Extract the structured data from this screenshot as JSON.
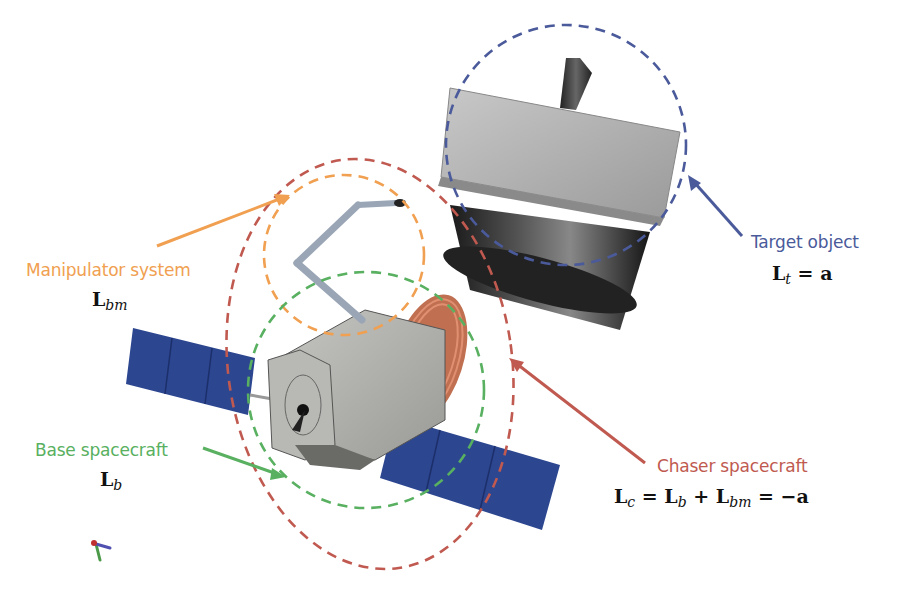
{
  "colors": {
    "target": "#4a5a9a",
    "manipulator": "#f0a050",
    "base": "#58b060",
    "chaser": "#c05a50",
    "panel": "#2c4690"
  },
  "labels": {
    "target": {
      "title": "Target object",
      "eq_symbol": "L",
      "eq_sub": "t",
      "eq_rhs": " = a"
    },
    "manipulator": {
      "title": "Manipulator system",
      "eq_symbol": "L",
      "eq_sub": "bm"
    },
    "base": {
      "title": "Base spacecraft",
      "eq_symbol": "L",
      "eq_sub": "b"
    },
    "chaser": {
      "title": "Chaser spacecraft",
      "eq_parts": [
        "L",
        "c",
        " = ",
        "L",
        "b",
        " + ",
        "L",
        "bm",
        " = −a"
      ]
    }
  },
  "regions": [
    {
      "name": "target-object-region",
      "style": "dashed",
      "color": "#4a5a9a",
      "shape": "circle"
    },
    {
      "name": "manipulator-system-region",
      "style": "dashed",
      "color": "#f0a050",
      "shape": "circle"
    },
    {
      "name": "base-spacecraft-region",
      "style": "dashed",
      "color": "#58b060",
      "shape": "circle"
    },
    {
      "name": "chaser-spacecraft-region",
      "style": "dashed",
      "color": "#c05a50",
      "shape": "ellipse"
    }
  ],
  "objects": [
    "target-object",
    "chaser-spacecraft-body",
    "manipulator-arm",
    "solar-panel-left",
    "solar-panel-right",
    "coordinate-axes"
  ]
}
